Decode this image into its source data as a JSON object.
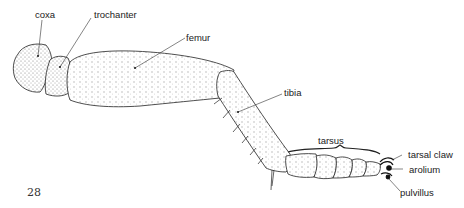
{
  "figure": {
    "page_number": "28",
    "labels": {
      "coxa": "coxa",
      "trochanter": "trochanter",
      "femur": "femur",
      "tibia": "tibia",
      "tarsus": "tarsus",
      "tarsal_claw": "tarsal claw",
      "arolium": "arolium",
      "pulvillus": "pulvillus"
    },
    "colors": {
      "line": "#222222",
      "stipple": "#888888",
      "background": "#ffffff"
    }
  }
}
